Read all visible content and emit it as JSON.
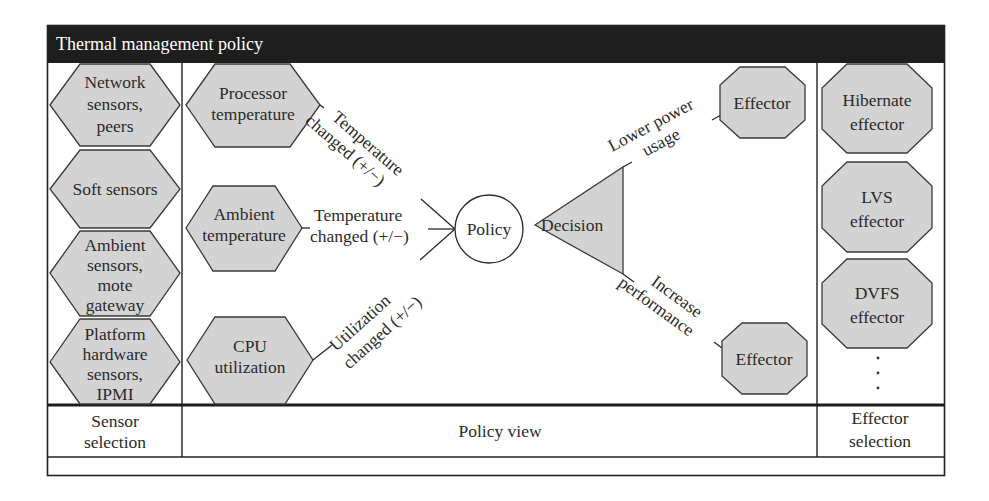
{
  "header": {
    "title": "Thermal management policy"
  },
  "sensor_selection": {
    "label_line1": "Sensor",
    "label_line2": "selection",
    "items": [
      {
        "lines": [
          "Network",
          "sensors,",
          "peers"
        ]
      },
      {
        "lines": [
          "Soft sensors"
        ]
      },
      {
        "lines": [
          "Ambient",
          "sensors,",
          "mote",
          "gateway"
        ]
      },
      {
        "lines": [
          "Platform",
          "hardware",
          "sensors,",
          "IPMI"
        ]
      }
    ]
  },
  "policy_view": {
    "label": "Policy view",
    "inputs": [
      {
        "lines": [
          "Processor",
          "temperature"
        ],
        "edge_line1": "Temperature",
        "edge_line2": "changed (+/−)"
      },
      {
        "lines": [
          "Ambient",
          "temperature"
        ],
        "edge_line1": "Temperature",
        "edge_line2": "changed (+/−)"
      },
      {
        "lines": [
          "CPU",
          "utilization"
        ],
        "edge_line1": "Utilization",
        "edge_line2": "changed (+/−)"
      }
    ],
    "policy_node": "Policy",
    "decision_node": "Decision",
    "outputs": [
      {
        "edge_line1": "Lower power",
        "edge_line2": "usage",
        "node": "Effector"
      },
      {
        "edge_line1": "Increase",
        "edge_line2": "performance",
        "node": "Effector"
      }
    ]
  },
  "effector_selection": {
    "label_line1": "Effector",
    "label_line2": "selection",
    "items": [
      {
        "lines": [
          "Hibernate",
          "effector"
        ]
      },
      {
        "lines": [
          "LVS",
          "effector"
        ]
      },
      {
        "lines": [
          "DVFS",
          "effector"
        ]
      }
    ],
    "more_indicator": "⋮"
  },
  "colors": {
    "header_bg": "#1e1e1e",
    "shape_fill": "#d3d3d3",
    "stroke": "#2a2a2a"
  }
}
